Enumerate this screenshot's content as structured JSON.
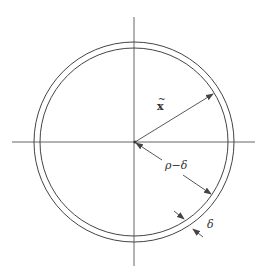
{
  "diagram": {
    "title": "",
    "center": {
      "x": 134,
      "y": 142
    },
    "outer_circle": {
      "radius": 100
    },
    "inner_circle": {
      "radius": 94
    },
    "axes": {
      "horizontal": {
        "x1": 12,
        "x2": 255,
        "y": 142
      },
      "vertical": {
        "x": 134,
        "y1": 17,
        "y2": 266
      }
    },
    "colors": {
      "stroke": "#444444",
      "background": "#ffffff"
    },
    "labels": {
      "x_tilde": {
        "base": "x",
        "accent": "~"
      },
      "rho_minus_delta": "ρ−δ",
      "delta": "δ"
    },
    "arrows": [
      {
        "name": "x-tilde-radius",
        "from": [
          134,
          142
        ],
        "to": [
          213,
          94
        ]
      },
      {
        "name": "rho-minus-delta-radius",
        "from": [
          134,
          142
        ],
        "to": [
          211,
          194
        ]
      },
      {
        "name": "delta-thickness-outer",
        "from": [
          174,
          211
        ],
        "to": [
          185,
          219
        ]
      },
      {
        "name": "delta-thickness-inner",
        "from": [
          207,
          238
        ],
        "to": [
          195,
          229
        ]
      }
    ]
  }
}
